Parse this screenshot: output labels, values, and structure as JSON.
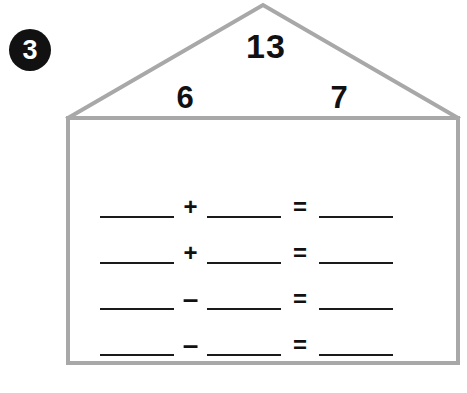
{
  "problem": {
    "number": "3",
    "badge_bg": "#111111",
    "badge_fg": "#ffffff"
  },
  "house": {
    "outline_color": "#a8a8a8",
    "fill_color": "#ffffff",
    "roof": {
      "sum": "13",
      "addend_left": "6",
      "addend_right": "7"
    }
  },
  "equations": [
    {
      "left": "",
      "operator": "+",
      "right": "",
      "equals": "=",
      "result": ""
    },
    {
      "left": "",
      "operator": "+",
      "right": "",
      "equals": "=",
      "result": ""
    },
    {
      "left": "",
      "operator": "–",
      "right": "",
      "equals": "=",
      "result": ""
    },
    {
      "left": "",
      "operator": "–",
      "right": "",
      "equals": "=",
      "result": ""
    }
  ],
  "ink_color": "#1a1a1a"
}
